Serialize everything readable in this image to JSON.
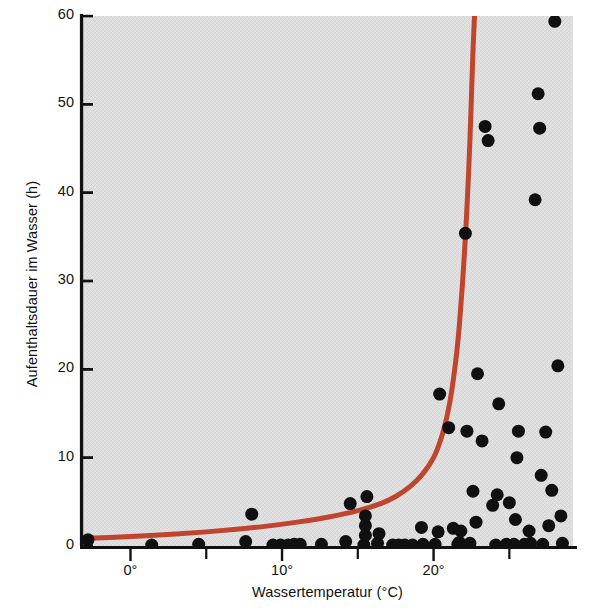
{
  "chart_data": {
    "type": "scatter",
    "title": "",
    "subtitle": "",
    "xlabel": "Wassertemperatur (°C)",
    "ylabel": "Aufenthaltsdauer im Wasser (h)",
    "xlim": [
      -3.2,
      29.2
    ],
    "ylim": [
      0,
      60
    ],
    "xticks": [
      0,
      10,
      20
    ],
    "xtick_labels": [
      "0°",
      "10°",
      "20°"
    ],
    "yticks": [
      0,
      10,
      20,
      30,
      40,
      50,
      60
    ],
    "ytick_labels": [
      "0",
      "10",
      "20",
      "30",
      "40",
      "50",
      "60"
    ],
    "grid": false,
    "legend": null,
    "plot_background": "#dedede",
    "point_color": "#101010",
    "point_radius_px": 6.5,
    "curve_color": "#c0452f",
    "curve_width_px": 5,
    "series": [
      {
        "name": "Messpunkte",
        "type": "scatter",
        "marker": "circle",
        "color": "#101010",
        "points": [
          [
            -2.8,
            0.7
          ],
          [
            1.4,
            0.1
          ],
          [
            4.5,
            0.2
          ],
          [
            7.6,
            0.5
          ],
          [
            8.0,
            3.6
          ],
          [
            9.4,
            0.1
          ],
          [
            9.9,
            0.1
          ],
          [
            10.4,
            0.1
          ],
          [
            10.8,
            0.2
          ],
          [
            11.2,
            0.2
          ],
          [
            12.6,
            0.2
          ],
          [
            14.2,
            0.5
          ],
          [
            14.5,
            4.8
          ],
          [
            15.4,
            0.1
          ],
          [
            15.5,
            1.2
          ],
          [
            15.5,
            2.3
          ],
          [
            15.5,
            3.4
          ],
          [
            15.6,
            5.6
          ],
          [
            16.3,
            0.3
          ],
          [
            16.4,
            1.4
          ],
          [
            17.3,
            0.1
          ],
          [
            17.7,
            0.1
          ],
          [
            18.1,
            0.1
          ],
          [
            18.6,
            0.1
          ],
          [
            19.2,
            2.1
          ],
          [
            19.3,
            0.2
          ],
          [
            20.1,
            0.2
          ],
          [
            20.3,
            1.6
          ],
          [
            20.4,
            17.2
          ],
          [
            21.0,
            13.4
          ],
          [
            21.3,
            2.0
          ],
          [
            21.6,
            0.2
          ],
          [
            21.7,
            0.4
          ],
          [
            21.8,
            1.7
          ],
          [
            22.1,
            35.4
          ],
          [
            22.2,
            13.0
          ],
          [
            22.4,
            0.3
          ],
          [
            22.6,
            6.2
          ],
          [
            22.8,
            2.7
          ],
          [
            22.9,
            19.5
          ],
          [
            23.2,
            11.9
          ],
          [
            23.4,
            47.5
          ],
          [
            23.6,
            45.9
          ],
          [
            23.9,
            4.6
          ],
          [
            24.1,
            0.1
          ],
          [
            24.2,
            5.8
          ],
          [
            24.3,
            16.1
          ],
          [
            24.8,
            0.2
          ],
          [
            25.0,
            4.9
          ],
          [
            25.3,
            0.2
          ],
          [
            25.4,
            3.0
          ],
          [
            25.5,
            10.0
          ],
          [
            25.6,
            13.0
          ],
          [
            26.0,
            0.2
          ],
          [
            26.3,
            1.7
          ],
          [
            26.4,
            0.3
          ],
          [
            26.7,
            39.2
          ],
          [
            26.9,
            51.2
          ],
          [
            27.0,
            47.3
          ],
          [
            27.1,
            8.0
          ],
          [
            27.2,
            0.2
          ],
          [
            27.4,
            12.9
          ],
          [
            27.6,
            2.3
          ],
          [
            27.8,
            6.3
          ],
          [
            28.0,
            59.4
          ],
          [
            28.2,
            20.4
          ],
          [
            28.4,
            3.4
          ],
          [
            28.5,
            0.3
          ]
        ]
      },
      {
        "name": "Modellkurve",
        "type": "line",
        "color": "#c0452f",
        "points": [
          [
            -3.2,
            0.85
          ],
          [
            -1.0,
            1.0
          ],
          [
            1.0,
            1.15
          ],
          [
            3.0,
            1.35
          ],
          [
            5.0,
            1.6
          ],
          [
            7.0,
            1.9
          ],
          [
            9.0,
            2.25
          ],
          [
            11.0,
            2.7
          ],
          [
            13.0,
            3.25
          ],
          [
            15.0,
            4.0
          ],
          [
            16.5,
            4.8
          ],
          [
            17.5,
            5.6
          ],
          [
            18.5,
            6.8
          ],
          [
            19.3,
            8.2
          ],
          [
            20.0,
            10.0
          ],
          [
            20.5,
            12.2
          ],
          [
            20.9,
            14.8
          ],
          [
            21.2,
            17.6
          ],
          [
            21.5,
            21.5
          ],
          [
            21.7,
            25.0
          ],
          [
            21.9,
            29.5
          ],
          [
            22.1,
            35.0
          ],
          [
            22.25,
            40.0
          ],
          [
            22.4,
            46.0
          ],
          [
            22.5,
            51.0
          ],
          [
            22.6,
            56.0
          ],
          [
            22.7,
            60.0
          ]
        ]
      }
    ]
  }
}
